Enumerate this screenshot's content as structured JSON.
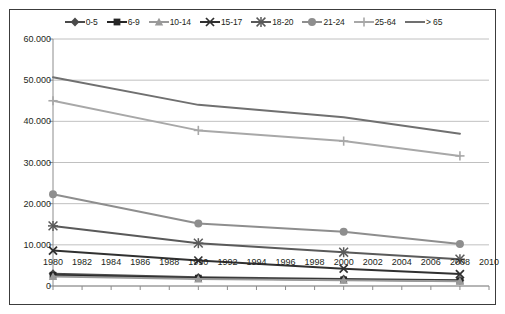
{
  "chart_data": {
    "type": "line",
    "title": "",
    "subtitle": "",
    "xlabel": "",
    "ylabel": "",
    "grid": true,
    "legend_position": "top",
    "xlim": [
      1980,
      2010
    ],
    "ylim": [
      0,
      60000
    ],
    "ytick_labels": [
      "0",
      "10.000",
      "20.000",
      "30.000",
      "40.000",
      "50.000",
      "60.000"
    ],
    "ytick_values": [
      0,
      10000,
      20000,
      30000,
      40000,
      50000,
      60000
    ],
    "xtick_labels": [
      "1980",
      "1982",
      "1984",
      "1986",
      "1988",
      "1990",
      "1992",
      "1994",
      "1996",
      "1998",
      "2000",
      "2002",
      "2004",
      "2006",
      "2008",
      "2010"
    ],
    "xtick_values": [
      1980,
      1982,
      1984,
      1986,
      1988,
      1990,
      1992,
      1994,
      1996,
      1998,
      2000,
      2002,
      2004,
      2006,
      2008,
      2010
    ],
    "x": [
      1980,
      1990,
      2000,
      2008
    ],
    "series": [
      {
        "name": "0-5",
        "marker": "diamond",
        "color": "#4a4a4a",
        "values": [
          3000,
          2100,
          1700,
          1400
        ]
      },
      {
        "name": "6-9",
        "marker": "square",
        "color": "#262626",
        "values": [
          2600,
          1900,
          1500,
          1250
        ]
      },
      {
        "name": "10-14",
        "marker": "triangle",
        "color": "#9a9a9a",
        "values": [
          2300,
          1700,
          1400,
          1150
        ]
      },
      {
        "name": "15-17",
        "marker": "cross-x",
        "color": "#303030",
        "values": [
          8600,
          6200,
          4200,
          2900
        ]
      },
      {
        "name": "18-20",
        "marker": "asterisk",
        "color": "#5a5a5a",
        "values": [
          14600,
          10400,
          8200,
          6500
        ]
      },
      {
        "name": "21-24",
        "marker": "circle",
        "color": "#8e8e8e",
        "values": [
          22300,
          15200,
          13200,
          10200
        ]
      },
      {
        "name": "25-64",
        "marker": "plus",
        "color": "#a8a8a8",
        "values": [
          45000,
          37800,
          35200,
          31600
        ]
      },
      {
        "name": "> 65",
        "marker": "none",
        "color": "#707070",
        "values": [
          50700,
          44000,
          41000,
          37000
        ]
      }
    ]
  },
  "legend": {
    "items": [
      {
        "label": "0-5"
      },
      {
        "label": "6-9"
      },
      {
        "label": "10-14"
      },
      {
        "label": "15-17"
      },
      {
        "label": "18-20"
      },
      {
        "label": "21-24"
      },
      {
        "label": "25-64"
      },
      {
        "label": "> 65"
      }
    ]
  },
  "axes": {
    "gridline_color": "#b0b0b0",
    "axis_color": "#8c8c8c",
    "border_color": "#3c3c3c"
  }
}
